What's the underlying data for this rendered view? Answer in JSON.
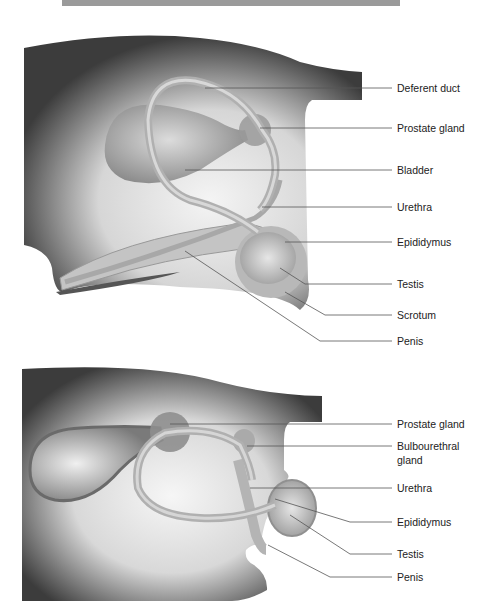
{
  "figures": [
    {
      "id": "bull",
      "description": "Lateral view of male reproductive tract (upper figure)",
      "labels": [
        {
          "text": "Deferent duct",
          "y": 88
        },
        {
          "text": "Prostate gland",
          "y": 128
        },
        {
          "text": "Bladder",
          "y": 170
        },
        {
          "text": "Urethra",
          "y": 207
        },
        {
          "text": "Epididymus",
          "y": 242
        },
        {
          "text": "Testis",
          "y": 284
        },
        {
          "text": "Scrotum",
          "y": 315
        },
        {
          "text": "Penis",
          "y": 341
        }
      ]
    },
    {
      "id": "dog",
      "description": "Lateral view of male reproductive tract (lower figure)",
      "labels": [
        {
          "text": "Prostate gland",
          "y": 424
        },
        {
          "text": "Bulbourethral",
          "y": 446
        },
        {
          "text": "gland",
          "y": 460
        },
        {
          "text": "Urethra",
          "y": 488
        },
        {
          "text": "Epididymus",
          "y": 522
        },
        {
          "text": "Testis",
          "y": 554
        },
        {
          "text": "Penis",
          "y": 577
        }
      ]
    }
  ],
  "colors": {
    "body_dark": "#3a3a3a",
    "body_light": "#f0f0f0",
    "organ": "#bdbdbd",
    "leader_line": "#555555",
    "banner": "#9a9a9a"
  }
}
